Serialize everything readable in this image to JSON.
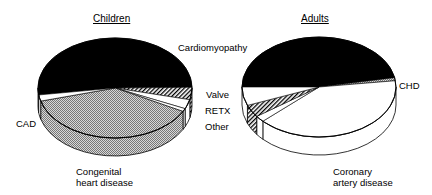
{
  "chart_data": [
    {
      "type": "pie",
      "title": "Children",
      "style": "3d-pie",
      "slices": [
        {
          "label": "Cardiomyopathy",
          "value": 52,
          "fill": "black"
        },
        {
          "label": "Valve",
          "value": 4,
          "fill": "hatched"
        },
        {
          "label": "RETX",
          "value": 3,
          "fill": "white"
        },
        {
          "label": "Other",
          "value": 1,
          "fill": "white"
        },
        {
          "label": "Congenital heart disease",
          "value": 38,
          "fill": "stippled"
        },
        {
          "label": "CAD",
          "value": 2,
          "fill": "white"
        }
      ]
    },
    {
      "type": "pie",
      "title": "Adults",
      "style": "3d-pie",
      "slices": [
        {
          "label": "Cardiomyopathy",
          "value": 47,
          "fill": "black"
        },
        {
          "label": "CHD",
          "value": 1,
          "fill": "stippled"
        },
        {
          "label": "Coronary artery disease",
          "value": 40,
          "fill": "white"
        },
        {
          "label": "Other",
          "value": 2,
          "fill": "white"
        },
        {
          "label": "Valve",
          "value": 4,
          "fill": "hatched"
        },
        {
          "label": "RETX",
          "value": 6,
          "fill": "white"
        }
      ]
    }
  ],
  "labels": {
    "children_title": "Children",
    "adults_title": "Adults",
    "cardiomyopathy": "Cardiomyopathy",
    "valve": "Valve",
    "retx": "RETX",
    "other": "Other",
    "cad": "CAD",
    "chd": "CHD",
    "congenital_1": "Congenital",
    "congenital_2": "heart disease",
    "coronary_1": "Coronary",
    "coronary_2": "artery disease"
  }
}
